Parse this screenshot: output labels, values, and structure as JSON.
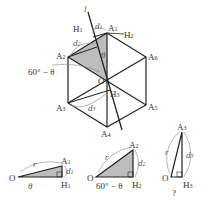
{
  "figure": {
    "main": {
      "center_label": "O",
      "line_label": "l",
      "vertices": [
        "A1",
        "A2",
        "A3",
        "A4",
        "A5",
        "A6"
      ],
      "feet": [
        "H1",
        "H2",
        "H3"
      ],
      "distances": [
        "d1",
        "d2",
        "d3"
      ],
      "angle_theta": "θ",
      "angle_60_minus_theta": "60° − θ"
    },
    "triangles": [
      {
        "origin": "O",
        "apex": "A1",
        "foot": "H1",
        "hyp": "r",
        "leg": "d1",
        "angle": "θ"
      },
      {
        "origin": "O",
        "apex": "A2",
        "foot": "H2",
        "hyp": "r",
        "leg": "d2",
        "angle": "60° − θ"
      },
      {
        "origin": "O",
        "apex": "A3",
        "foot": "H3",
        "hyp": "r",
        "leg": "d3",
        "angle": "?"
      }
    ],
    "colors": {
      "stroke": "#222222",
      "shade": "#bdbdbd",
      "annotation": "#888888"
    }
  }
}
